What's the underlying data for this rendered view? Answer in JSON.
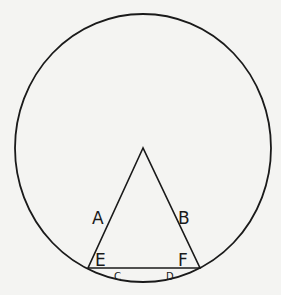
{
  "diagram": {
    "stroke_color": "#1a1a1a",
    "background": "#f4f4f2",
    "circle": {
      "cx": 143,
      "cy": 148,
      "r": 128
    },
    "triangle": {
      "apex": [
        143,
        148
      ],
      "left": [
        88,
        268
      ],
      "right": [
        200,
        268
      ]
    },
    "labels": {
      "A": "A",
      "B": "B",
      "C": "C",
      "D": "D",
      "E": "E",
      "F": "F"
    }
  }
}
